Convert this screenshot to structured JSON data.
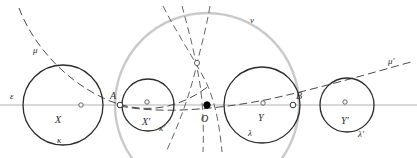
{
  "figure": {
    "width": 417,
    "height": 158,
    "background": "#ffffff"
  },
  "colors": {
    "stroke_dark": "#2b2b2b",
    "stroke_gray": "#9a9a9a",
    "stroke_light_gray": "#c8c8c8",
    "axis_gray": "#b0b0b0",
    "marker_fill": "#ffffff",
    "point_fill": "#000000"
  },
  "labels": {
    "epsilon": {
      "text": "ε",
      "x": 10,
      "y": 99
    },
    "mu": {
      "text": "μ",
      "x": 33,
      "y": 53
    },
    "mu_prime": {
      "text": "μ′",
      "x": 388,
      "y": 64
    },
    "nu": {
      "text": "ν",
      "x": 250,
      "y": 23
    },
    "X": {
      "text": "X",
      "x": 55,
      "y": 123
    },
    "kappa": {
      "text": "κ",
      "x": 57,
      "y": 143
    },
    "A": {
      "text": "A",
      "x": 110,
      "y": 99
    },
    "X_prime": {
      "text": "X′",
      "x": 142,
      "y": 125
    },
    "kappa_prime": {
      "text": "κ′",
      "x": 159,
      "y": 131
    },
    "O": {
      "text": "O",
      "x": 201,
      "y": 122
    },
    "Y": {
      "text": "Y",
      "x": 258,
      "y": 121
    },
    "lambda": {
      "text": "λ",
      "x": 248,
      "y": 136
    },
    "B": {
      "text": "B",
      "x": 296,
      "y": 99
    },
    "Y_prime": {
      "text": "Y′",
      "x": 341,
      "y": 124
    },
    "lambda_prime": {
      "text": "λ′",
      "x": 358,
      "y": 137
    }
  },
  "line_epsilon": {
    "x1": 0,
    "y1": 105,
    "x2": 417,
    "y2": 105
  },
  "circles": [
    {
      "name": "kappa",
      "cx": 63,
      "cy": 105,
      "r": 40,
      "style": "dark"
    },
    {
      "name": "kappa-prime",
      "cx": 148,
      "cy": 105,
      "r": 26,
      "style": "dark"
    },
    {
      "name": "lambda",
      "cx": 262,
      "cy": 105,
      "r": 38,
      "style": "dark"
    },
    {
      "name": "lambda-prime",
      "cx": 347,
      "cy": 105,
      "r": 27,
      "style": "dark"
    },
    {
      "name": "nu",
      "cx": 207,
      "cy": 105,
      "r": 92,
      "style": "light-gray"
    }
  ],
  "points": [
    {
      "name": "A",
      "cx": 120,
      "cy": 105,
      "kind": "open"
    },
    {
      "name": "O",
      "cx": 207,
      "cy": 105,
      "kind": "filled"
    },
    {
      "name": "B",
      "cx": 293,
      "cy": 105,
      "kind": "open"
    },
    {
      "name": "P",
      "cx": 197,
      "cy": 63,
      "kind": "open"
    },
    {
      "name": "m1",
      "cx": 81,
      "cy": 105,
      "kind": "open"
    },
    {
      "name": "m2",
      "cx": 147,
      "cy": 102,
      "kind": "open"
    },
    {
      "name": "m3",
      "cx": 263,
      "cy": 103,
      "kind": "open"
    },
    {
      "name": "m4",
      "cx": 345,
      "cy": 102,
      "kind": "open"
    }
  ],
  "arcs": {
    "mu": "M 19,8 C 30,38 60,80 110,101 C 150,117 185,105 210,85",
    "mu_prime": "M 120,106 C 160,114 215,110 270,99 C 320,88 375,72 411,62",
    "dash_left": "M 163,6 C 175,30 190,52 205,80 C 213,96 219,118 222,152",
    "dash_mid": "M 182,6 C 188,28 194,50 199,78 C 203,102 204,128 203,152",
    "dash_right": "M 210,6 C 206,30 200,50 195,72 C 188,100 178,126 166,152"
  }
}
